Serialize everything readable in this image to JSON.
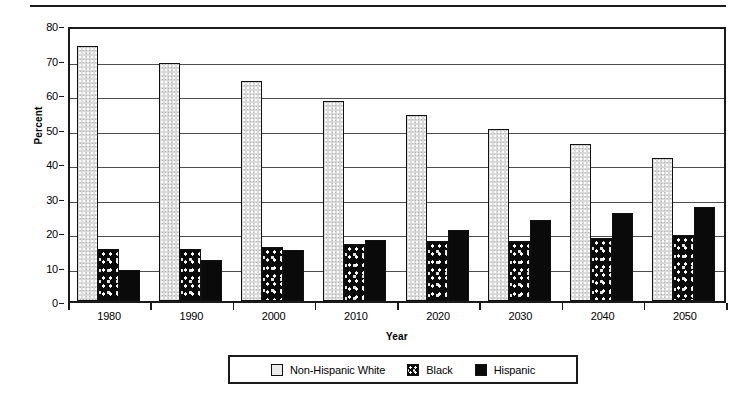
{
  "chart_data": {
    "type": "bar",
    "title": "",
    "xlabel": "Year",
    "ylabel": "Percent",
    "categories": [
      "1980",
      "1990",
      "2000",
      "2010",
      "2020",
      "2030",
      "2040",
      "2050"
    ],
    "series": [
      {
        "name": "Non-Hispanic White",
        "fill": "light-stipple",
        "values": [
          74.0,
          69.0,
          63.8,
          58.0,
          53.8,
          49.8,
          45.6,
          41.4
        ]
      },
      {
        "name": "Black",
        "fill": "dark-dotted",
        "values": [
          15.0,
          15.0,
          15.6,
          16.5,
          17.5,
          17.5,
          18.4,
          19.2
        ]
      },
      {
        "name": "Hispanic",
        "fill": "solid-black",
        "values": [
          9.0,
          11.8,
          14.7,
          17.6,
          20.7,
          23.5,
          25.5,
          27.3
        ]
      }
    ],
    "ylim": [
      0,
      80
    ],
    "yticks": [
      0,
      10,
      20,
      30,
      40,
      50,
      60,
      70,
      80
    ],
    "ytick_labels": [
      "0",
      "10",
      "20",
      "30",
      "40",
      "50",
      "60",
      "70",
      "80"
    ],
    "grid": true,
    "legend_position": "bottom-center"
  },
  "legend": {
    "items": [
      {
        "label": "Non-Hispanic White",
        "swatch": "white"
      },
      {
        "label": "Black",
        "swatch": "black-dotted"
      },
      {
        "label": "Hispanic",
        "swatch": "solid-black"
      }
    ]
  }
}
